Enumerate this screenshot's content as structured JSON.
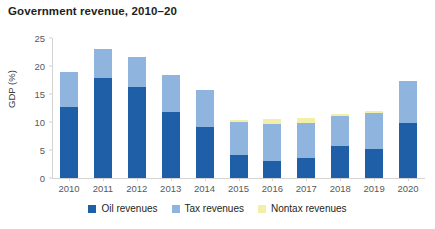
{
  "chart_data": {
    "type": "bar",
    "title": "Government revenue, 2010–20",
    "xlabel": "",
    "ylabel": "GDP (%)",
    "ylim": [
      0,
      25
    ],
    "yticks": [
      0,
      5,
      10,
      15,
      20,
      25
    ],
    "grid": false,
    "stacked": true,
    "legend_position": "bottom",
    "categories": [
      "2010",
      "2011",
      "2012",
      "2013",
      "2014",
      "2015",
      "2016",
      "2017",
      "2018",
      "2019",
      "2020"
    ],
    "series": [
      {
        "name": "Oil revenues",
        "color": "#1f5fa8",
        "values": [
          12.7,
          17.8,
          16.2,
          11.7,
          9.1,
          4.1,
          3.1,
          3.5,
          5.7,
          5.1,
          9.8
        ]
      },
      {
        "name": "Tax revenues",
        "color": "#8fb4de",
        "values": [
          6.2,
          5.2,
          5.4,
          6.7,
          6.6,
          5.9,
          6.6,
          6.4,
          5.3,
          6.6,
          7.6
        ]
      },
      {
        "name": "Nontax revenues",
        "color": "#f2f0a8",
        "values": [
          0.0,
          0.1,
          0.0,
          0.0,
          0.0,
          0.3,
          0.8,
          0.8,
          0.5,
          0.3,
          0.0
        ]
      }
    ],
    "totals": [
      18.9,
      23.1,
      21.6,
      18.4,
      15.7,
      10.3,
      10.5,
      10.7,
      11.5,
      12.0,
      17.4
    ]
  },
  "legend": {
    "items": [
      {
        "label": "Oil revenues",
        "color": "#1f5fa8"
      },
      {
        "label": "Tax revenues",
        "color": "#8fb4de"
      },
      {
        "label": "Nontax revenues",
        "color": "#f2f0a8"
      }
    ]
  }
}
